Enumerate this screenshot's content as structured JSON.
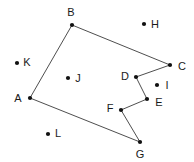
{
  "figure": {
    "type": "geometry-diagram",
    "width": 194,
    "height": 162,
    "background_color": "#ffffff",
    "stroke_color": "#3a3a3a",
    "point_color": "#111111",
    "label_color": "#1a1a1a",
    "point_radius": 2.1,
    "stroke_width": 0.9
  },
  "points": [
    {
      "id": "A",
      "label": "A",
      "x": 30,
      "y": 98,
      "label_x": 18,
      "label_y": 98,
      "on_polygon": true
    },
    {
      "id": "B",
      "label": "B",
      "x": 72,
      "y": 25,
      "label_x": 71,
      "label_y": 12,
      "on_polygon": true
    },
    {
      "id": "C",
      "label": "C",
      "x": 170,
      "y": 65,
      "label_x": 182,
      "label_y": 66,
      "on_polygon": true
    },
    {
      "id": "D",
      "label": "D",
      "x": 136,
      "y": 77,
      "label_x": 125,
      "label_y": 76,
      "on_polygon": true
    },
    {
      "id": "E",
      "label": "E",
      "x": 147,
      "y": 99,
      "label_x": 159,
      "label_y": 102,
      "on_polygon": true
    },
    {
      "id": "F",
      "label": "F",
      "x": 121,
      "y": 110,
      "label_x": 110,
      "label_y": 108,
      "on_polygon": true
    },
    {
      "id": "G",
      "label": "G",
      "x": 140,
      "y": 142,
      "label_x": 140,
      "label_y": 154,
      "on_polygon": true
    },
    {
      "id": "H",
      "label": "H",
      "x": 144,
      "y": 24,
      "label_x": 155,
      "label_y": 24,
      "on_polygon": false
    },
    {
      "id": "I",
      "label": "I",
      "x": 157,
      "y": 85,
      "label_x": 167,
      "label_y": 85,
      "on_polygon": false
    },
    {
      "id": "J",
      "label": "J",
      "x": 68,
      "y": 78,
      "label_x": 78,
      "label_y": 78,
      "on_polygon": false
    },
    {
      "id": "K",
      "label": "K",
      "x": 17,
      "y": 63,
      "label_x": 27,
      "label_y": 62,
      "on_polygon": false
    },
    {
      "id": "L",
      "label": "L",
      "x": 48,
      "y": 134,
      "label_x": 58,
      "label_y": 133,
      "on_polygon": false
    }
  ],
  "polygon": {
    "closed": true,
    "vertex_order": [
      "A",
      "B",
      "C",
      "D",
      "E",
      "F",
      "G"
    ],
    "edges": [
      {
        "from": "A",
        "to": "B"
      },
      {
        "from": "B",
        "to": "C"
      },
      {
        "from": "C",
        "to": "D"
      },
      {
        "from": "D",
        "to": "E"
      },
      {
        "from": "E",
        "to": "F"
      },
      {
        "from": "F",
        "to": "G"
      },
      {
        "from": "G",
        "to": "A"
      }
    ]
  },
  "isolated_points": [
    "H",
    "I",
    "J",
    "K",
    "L"
  ]
}
